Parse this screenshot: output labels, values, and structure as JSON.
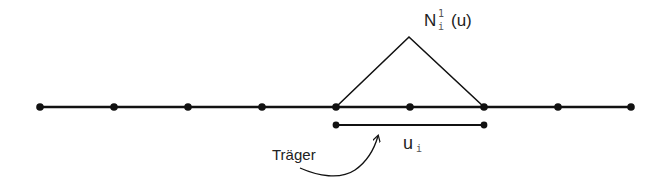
{
  "diagram": {
    "title_label": {
      "base": "N",
      "superscript": "1",
      "subscript": "i",
      "argument": "(u)"
    },
    "support_label": "Träger",
    "interval_label": {
      "base": "u",
      "subscript": "i"
    },
    "knots": [
      40,
      114,
      188,
      262,
      336,
      410,
      484,
      558,
      631
    ],
    "axis_y": 107,
    "hat_function": {
      "left": 336,
      "apex_x": 409,
      "apex_y": 37,
      "right": 484
    },
    "support_interval": {
      "start": 336,
      "end": 484,
      "y": 125
    },
    "colors": {
      "stroke": "#111111",
      "text": "#222222"
    }
  }
}
